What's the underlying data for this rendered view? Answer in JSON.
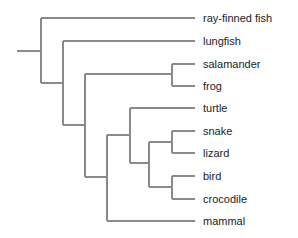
{
  "diagram": {
    "type": "phylogenetic-tree",
    "line_color": "#8a8a8a",
    "text_color": "#222222",
    "taxa": [
      {
        "name": "ray-finned fish",
        "y": 18
      },
      {
        "name": "lungfish",
        "y": 41
      },
      {
        "name": "salamander",
        "y": 64
      },
      {
        "name": "frog",
        "y": 86
      },
      {
        "name": "turtle",
        "y": 108
      },
      {
        "name": "snake",
        "y": 131
      },
      {
        "name": "lizard",
        "y": 153
      },
      {
        "name": "bird",
        "y": 176
      },
      {
        "name": "crocodile",
        "y": 199
      },
      {
        "name": "mammal",
        "y": 221
      }
    ],
    "tree_newick": "(ray-finned fish,(lungfish,((salamander,frog),((turtle,((snake,lizard),(bird,crocodile))),mammal))));"
  }
}
